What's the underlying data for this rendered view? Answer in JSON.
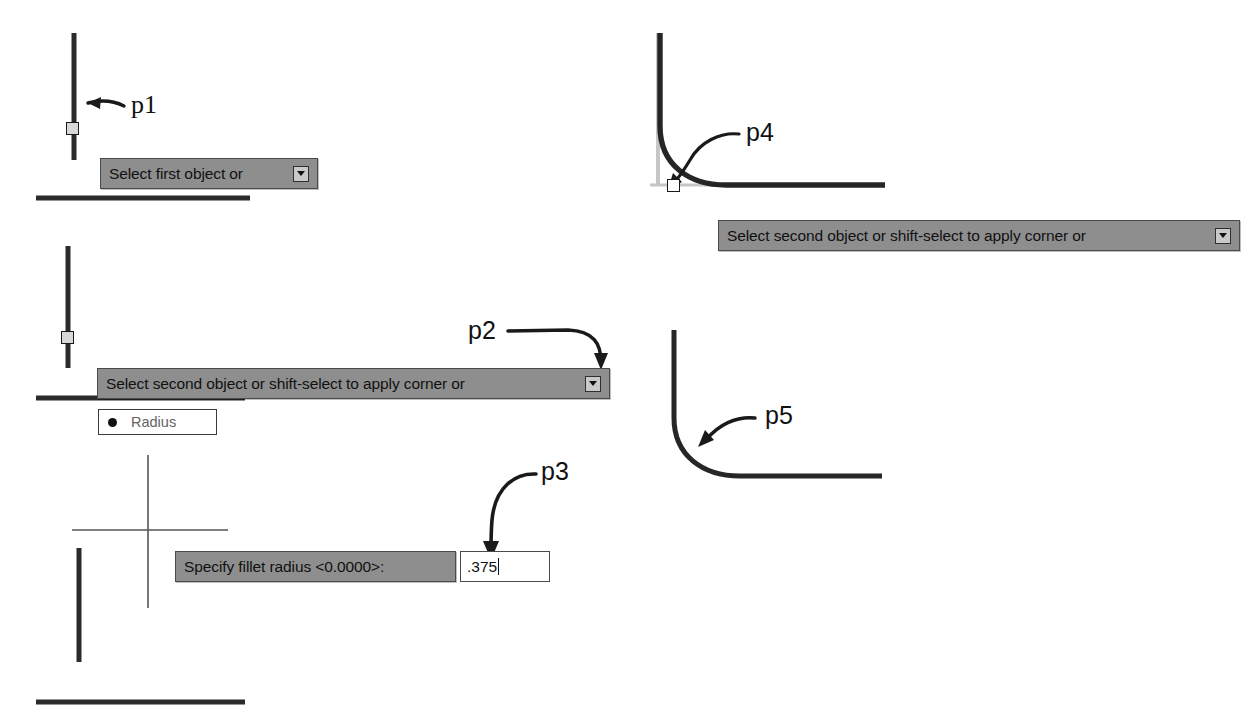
{
  "figure": {
    "background_color": "#ffffff",
    "line_color": "#1a1a1a",
    "tooltip_bg": "#8e8e8e",
    "tooltip_border": "#4a4a4a",
    "tooltip_text_color": "#111111",
    "menu_text_color": "#636363"
  },
  "steps": [
    {
      "id": "step1",
      "point_label": "p1",
      "tooltip": "Select first object or",
      "dropdown_icon": "chevron-down-icon"
    },
    {
      "id": "step2",
      "point_label": "p2",
      "tooltip": "Select second object or shift-select to apply corner or",
      "dropdown_icon": "chevron-down-icon",
      "menu_option": "Radius",
      "menu_bullet_icon": "bullet-dot-icon"
    },
    {
      "id": "step3",
      "point_label": "p3",
      "tooltip": "Specify fillet radius <0.0000>:",
      "input_value": ".375",
      "input_caret": true
    },
    {
      "id": "step4",
      "point_label": "p4",
      "tooltip": "Select second object or shift-select to apply corner or",
      "dropdown_icon": "chevron-down-icon"
    },
    {
      "id": "step5",
      "point_label": "p5",
      "tooltip": null
    }
  ],
  "labels": {
    "p1": "p1",
    "p2": "p2",
    "p3": "p3",
    "p4": "p4",
    "p5": "p5"
  },
  "prompts": {
    "select_first": "Select first object or",
    "select_second": "Select second object or shift-select to apply corner or",
    "select_second_b": "Select second object or shift-select to apply corner or",
    "specify_radius": "Specify fillet radius <0.0000>:"
  },
  "menu": {
    "radius": "Radius"
  },
  "input": {
    "radius_value": ".375"
  }
}
